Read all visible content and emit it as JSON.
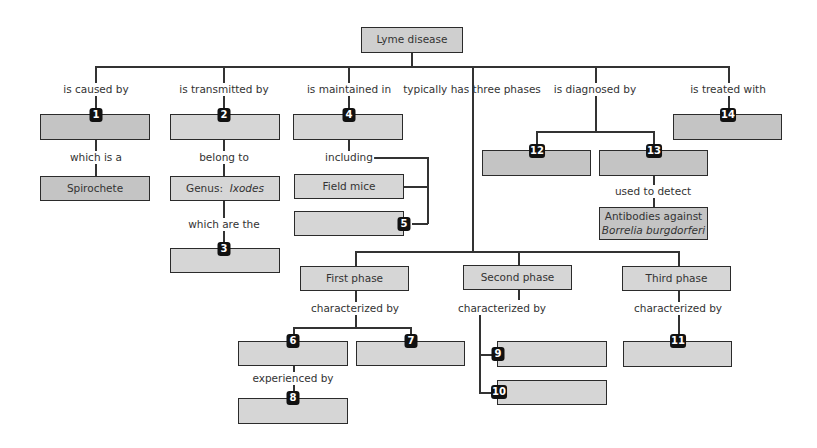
{
  "title": "Lyme disease",
  "links": {
    "caused_by": "is caused by",
    "transmitted_by": "is transmitted by",
    "maintained_in": "is maintained in",
    "three_phases": "typically has three phases",
    "diagnosed_by": "is diagnosed by",
    "treated_with": "is treated with",
    "which_is_a": "which is a",
    "belong_to": "belong to",
    "which_are_the": "which are the",
    "including": "including",
    "used_to_detect": "used to detect",
    "first_characterized_by": "characterized by",
    "second_characterized_by": "characterized by",
    "third_characterized_by": "characterized by",
    "experienced_by": "experienced by"
  },
  "nodes": {
    "spirochete": "Spirochete",
    "genus_prefix": "Genus: ",
    "genus_name": "Ixodes",
    "field_mice": "Field mice",
    "antibodies_line1": "Antibodies against",
    "antibodies_line2": "Borrelia burgdorferi",
    "first_phase": "First phase",
    "second_phase": "Second phase",
    "third_phase": "Third phase"
  },
  "badges": {
    "b1": "1",
    "b2": "2",
    "b3": "3",
    "b4": "4",
    "b5": "5",
    "b6": "6",
    "b7": "7",
    "b8": "8",
    "b9": "9",
    "b10": "10",
    "b11": "11",
    "b12": "12",
    "b13": "13",
    "b14": "14"
  },
  "colors": {
    "box_fill": "#cfcfcf",
    "border": "#2b2b2b",
    "badge": "#111111"
  }
}
